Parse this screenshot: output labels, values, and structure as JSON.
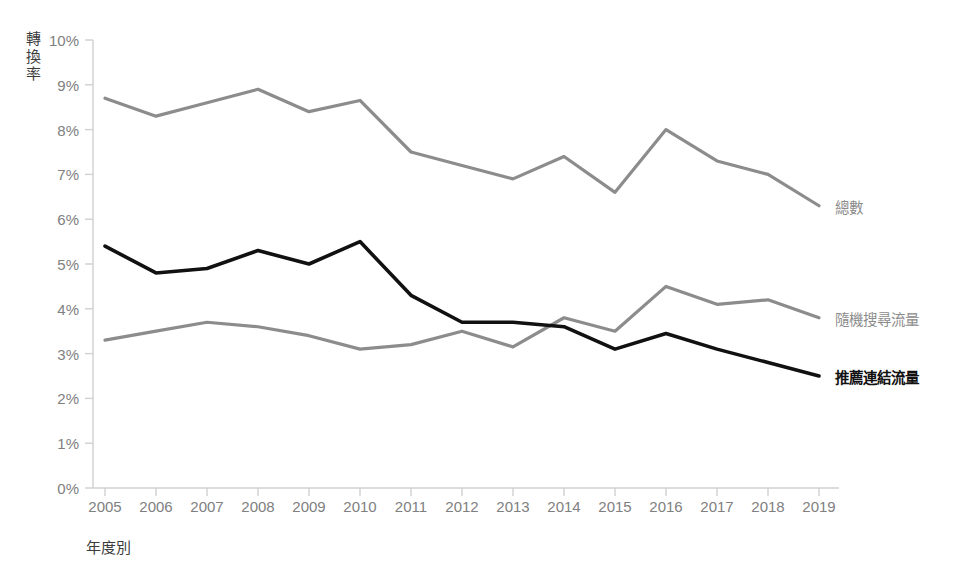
{
  "chart_data": {
    "type": "line",
    "title": "",
    "xlabel": "年度別",
    "ylabel": "轉換率",
    "x": [
      2005,
      2006,
      2007,
      2008,
      2009,
      2010,
      2011,
      2012,
      2013,
      2014,
      2015,
      2016,
      2017,
      2018,
      2019
    ],
    "categories": [
      "2005",
      "2006",
      "2007",
      "2008",
      "2009",
      "2010",
      "2011",
      "2012",
      "2013",
      "2014",
      "2015",
      "2016",
      "2017",
      "2018",
      "2019"
    ],
    "ylim": [
      0,
      10
    ],
    "yticks": [
      0,
      1,
      2,
      3,
      4,
      5,
      6,
      7,
      8,
      9,
      10
    ],
    "ytick_labels": [
      "0%",
      "1%",
      "2%",
      "3%",
      "4%",
      "5%",
      "6%",
      "7%",
      "8%",
      "9%",
      "10%"
    ],
    "grid": false,
    "legend_position": "right-inline-end-of-line",
    "series": [
      {
        "name": "總數",
        "color": "#8c8c8c",
        "width": 3.2,
        "bold_label": false,
        "values": [
          8.7,
          8.3,
          8.6,
          8.9,
          8.4,
          8.65,
          7.5,
          7.2,
          6.9,
          7.4,
          6.6,
          8.0,
          7.3,
          7.0,
          6.3
        ]
      },
      {
        "name": "隨機搜尋流量",
        "color": "#8c8c8c",
        "width": 3.2,
        "bold_label": false,
        "values": [
          3.3,
          3.5,
          3.7,
          3.6,
          3.4,
          3.1,
          3.2,
          3.5,
          3.15,
          3.8,
          3.5,
          4.5,
          4.1,
          4.2,
          3.8
        ]
      },
      {
        "name": "推薦連結流量",
        "color": "#111111",
        "width": 3.6,
        "bold_label": true,
        "values": [
          5.4,
          4.8,
          4.9,
          5.3,
          5.0,
          5.5,
          4.3,
          3.7,
          3.7,
          3.6,
          3.1,
          3.45,
          3.1,
          2.8,
          2.5
        ]
      }
    ],
    "axis_color": "#d0d0d0",
    "tick_text_color": "#808080",
    "axis_title_color": "#3c3c3c"
  }
}
